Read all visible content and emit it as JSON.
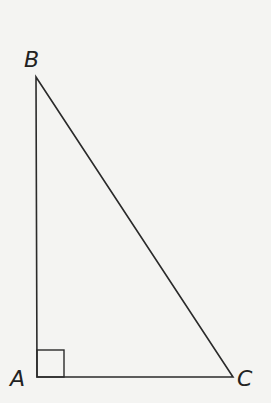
{
  "diagram": {
    "type": "right-triangle",
    "vertices": [
      {
        "name": "A",
        "x": 37,
        "y": 377,
        "label_x": 10,
        "label_y": 386
      },
      {
        "name": "B",
        "x": 36,
        "y": 77,
        "label_x": 24,
        "label_y": 67
      },
      {
        "name": "C",
        "x": 233,
        "y": 377,
        "label_x": 237,
        "label_y": 386
      }
    ],
    "right_angle_at": "A",
    "right_angle_marker_size": 28,
    "stroke_color": "#2a2a2a",
    "background_color": "#f4f4f2"
  }
}
